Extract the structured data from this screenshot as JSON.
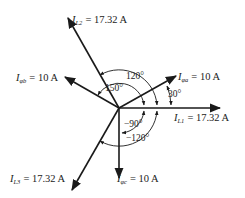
{
  "diagram": {
    "colors": {
      "ink": "#1a1a1a",
      "background": "#ffffff"
    },
    "phasors": [
      {
        "id": "IL1",
        "symbol": "I",
        "subscript": "L1",
        "value": "17.32 A",
        "angle_deg": 0
      },
      {
        "id": "IL2",
        "symbol": "I",
        "subscript": "L2",
        "value": "17.32 A",
        "angle_deg": 120
      },
      {
        "id": "IL3",
        "symbol": "I",
        "subscript": "L3",
        "value": "17.32 A",
        "angle_deg": -120
      },
      {
        "id": "Iphia",
        "symbol": "I",
        "subscript": "φa",
        "value": "10 A",
        "angle_deg": 30
      },
      {
        "id": "Iphib",
        "symbol": "I",
        "subscript": "φb",
        "value": "10 A",
        "angle_deg": 150
      },
      {
        "id": "Iphic",
        "symbol": "I",
        "subscript": "φc",
        "value": "10 A",
        "angle_deg": -90
      }
    ],
    "labels": {
      "IL1": {
        "sym": "I",
        "sub": "L1",
        "eq": "= 17.32 A"
      },
      "IL2": {
        "sym": "I",
        "sub": "L2",
        "eq": "= 17.32 A"
      },
      "IL3": {
        "sym": "I",
        "sub": "L3",
        "eq": "= 17.32 A"
      },
      "Iphia": {
        "sym": "I",
        "sub": "φa",
        "eq": "= 10 A"
      },
      "Iphib": {
        "sym": "I",
        "sub": "φb",
        "eq": "= 10 A"
      },
      "Iphic": {
        "sym": "I",
        "sub": "φc",
        "eq": "= 10 A"
      }
    },
    "angle_labels": {
      "a120": "120°",
      "a150": "150°",
      "a30": "30°",
      "am90": "−90°",
      "am120": "−120°"
    }
  }
}
